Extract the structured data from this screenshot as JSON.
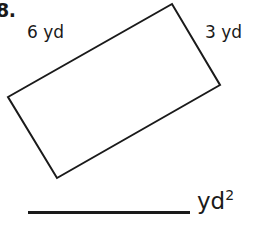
{
  "problem": {
    "number_label": "8."
  },
  "figure": {
    "shape_name": "rectangle",
    "labels": {
      "long_side": "6 yd",
      "short_side": "3 yd"
    },
    "stroke_color": "#1a1a1a",
    "fill_color": "#ffffff",
    "stroke_width": 2,
    "vertices": [
      {
        "x": 8,
        "y": 97
      },
      {
        "x": 172,
        "y": 4
      },
      {
        "x": 220,
        "y": 85
      },
      {
        "x": 57,
        "y": 178
      }
    ]
  },
  "answer": {
    "blank_line": "",
    "unit_base": "yd",
    "unit_exponent": "2"
  }
}
